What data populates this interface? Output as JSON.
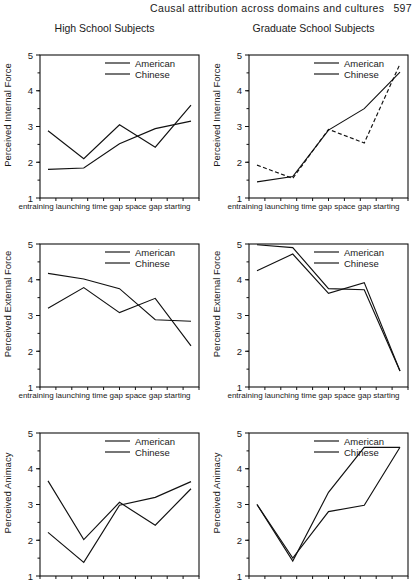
{
  "page": {
    "running_head": "Causal attribution across domains and cultures",
    "page_number": "597"
  },
  "legend": {
    "american": "American",
    "chinese": "Chinese"
  },
  "axis": {
    "x_tick_label_line": "entraining launching time gap space gap starting",
    "categories": [
      "entraining",
      "launching",
      "time gap",
      "space gap",
      "starting"
    ],
    "y_ticks": [
      "5",
      "4",
      "3",
      "2",
      "1"
    ],
    "ylim": [
      1,
      5
    ]
  },
  "panels": [
    {
      "column_title": "High School Subjects",
      "ylabel": "Perceived Internal Force",
      "show_title": true
    },
    {
      "column_title": "Graduate School Subjects",
      "ylabel": "Perceived Internal Force",
      "show_title": true
    },
    {
      "column_title": "",
      "ylabel": "Perceived External Force",
      "show_title": false
    },
    {
      "column_title": "",
      "ylabel": "Perceived External Force",
      "show_title": false
    },
    {
      "column_title": "",
      "ylabel": "Perceived Animacy",
      "show_title": false
    },
    {
      "column_title": "",
      "ylabel": "Perceived Animacy",
      "show_title": false
    }
  ],
  "chart_data": [
    {
      "type": "line",
      "title": "High School Subjects",
      "xlabel": "",
      "ylabel": "Perceived Internal Force",
      "categories": [
        "entraining",
        "launching",
        "time gap",
        "space gap",
        "starting"
      ],
      "ylim": [
        1,
        5
      ],
      "grid": false,
      "legend_position": "top-center",
      "series": [
        {
          "name": "American",
          "values": [
            2.88,
            2.1,
            3.05,
            2.42,
            3.6
          ]
        },
        {
          "name": "Chinese",
          "values": [
            1.8,
            1.84,
            2.52,
            2.94,
            3.15
          ]
        }
      ]
    },
    {
      "type": "line",
      "title": "Graduate School Subjects",
      "xlabel": "",
      "ylabel": "Perceived Internal Force",
      "categories": [
        "entraining",
        "launching",
        "time gap",
        "space gap",
        "starting"
      ],
      "ylim": [
        1,
        5
      ],
      "grid": false,
      "legend_position": "top-center",
      "series": [
        {
          "name": "American",
          "values": [
            1.92,
            1.55,
            2.92,
            2.54,
            4.75
          ]
        },
        {
          "name": "Chinese",
          "values": [
            1.45,
            1.6,
            2.9,
            3.5,
            4.52
          ]
        }
      ]
    },
    {
      "type": "line",
      "title": "",
      "xlabel": "",
      "ylabel": "Perceived External Force",
      "categories": [
        "entraining",
        "launching",
        "time gap",
        "space gap",
        "starting"
      ],
      "ylim": [
        1,
        5
      ],
      "grid": false,
      "legend_position": "top-center",
      "series": [
        {
          "name": "American",
          "values": [
            4.18,
            4.02,
            3.75,
            2.88,
            2.84
          ]
        },
        {
          "name": "Chinese",
          "values": [
            3.2,
            3.78,
            3.08,
            3.48,
            2.15
          ]
        }
      ]
    },
    {
      "type": "line",
      "title": "",
      "xlabel": "",
      "ylabel": "Perceived External Force",
      "categories": [
        "entraining",
        "launching",
        "time gap",
        "space gap",
        "starting"
      ],
      "ylim": [
        1,
        5
      ],
      "grid": false,
      "legend_position": "top-center",
      "series": [
        {
          "name": "American",
          "values": [
            4.98,
            4.9,
            3.75,
            3.72,
            1.45
          ]
        },
        {
          "name": "Chinese",
          "values": [
            4.25,
            4.72,
            3.62,
            3.92,
            1.45
          ]
        }
      ]
    },
    {
      "type": "line",
      "title": "",
      "xlabel": "",
      "ylabel": "Perceived Animacy",
      "categories": [
        "entraining",
        "launching",
        "time gap",
        "space gap",
        "starting"
      ],
      "ylim": [
        1,
        5
      ],
      "grid": false,
      "legend_position": "top-center",
      "series": [
        {
          "name": "American",
          "values": [
            3.66,
            2.02,
            3.06,
            2.42,
            3.44
          ]
        },
        {
          "name": "Chinese",
          "values": [
            2.22,
            1.38,
            2.98,
            3.2,
            3.64
          ]
        }
      ]
    },
    {
      "type": "line",
      "title": "",
      "xlabel": "",
      "ylabel": "Perceived Animacy",
      "categories": [
        "entraining",
        "launching",
        "time gap",
        "space gap",
        "starting"
      ],
      "ylim": [
        1,
        5
      ],
      "grid": false,
      "legend_position": "top-center",
      "series": [
        {
          "name": "American",
          "values": [
            3.0,
            1.42,
            3.34,
            4.6,
            4.6
          ]
        },
        {
          "name": "Chinese",
          "values": [
            3.0,
            1.5,
            2.8,
            2.98,
            4.6
          ]
        }
      ]
    }
  ]
}
